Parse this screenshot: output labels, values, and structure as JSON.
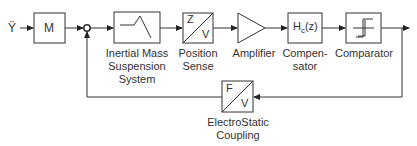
{
  "diagram": {
    "input_label": "Ÿ",
    "blocks": [
      {
        "id": "m",
        "text": "M",
        "label": ""
      },
      {
        "id": "inertial",
        "text": "",
        "label_lines": [
          "Inertial Mass",
          "Suspension",
          "System"
        ]
      },
      {
        "id": "position",
        "text_top": "Z",
        "text_bottom": "V",
        "label_lines": [
          "Position",
          "Sense"
        ]
      },
      {
        "id": "amplifier",
        "text": "",
        "label_lines": [
          "Amplifier"
        ]
      },
      {
        "id": "compensator",
        "text": "H",
        "text_sub": "c",
        "text_suffix": "(z)",
        "label_lines": [
          "Compen-",
          "sator"
        ]
      },
      {
        "id": "comparator",
        "text": "",
        "label_lines": [
          "Comparator"
        ]
      },
      {
        "id": "coupling",
        "text_top": "F",
        "text_bottom": "V",
        "label_lines": [
          "ElectroStatic",
          "Coupling"
        ]
      }
    ]
  }
}
